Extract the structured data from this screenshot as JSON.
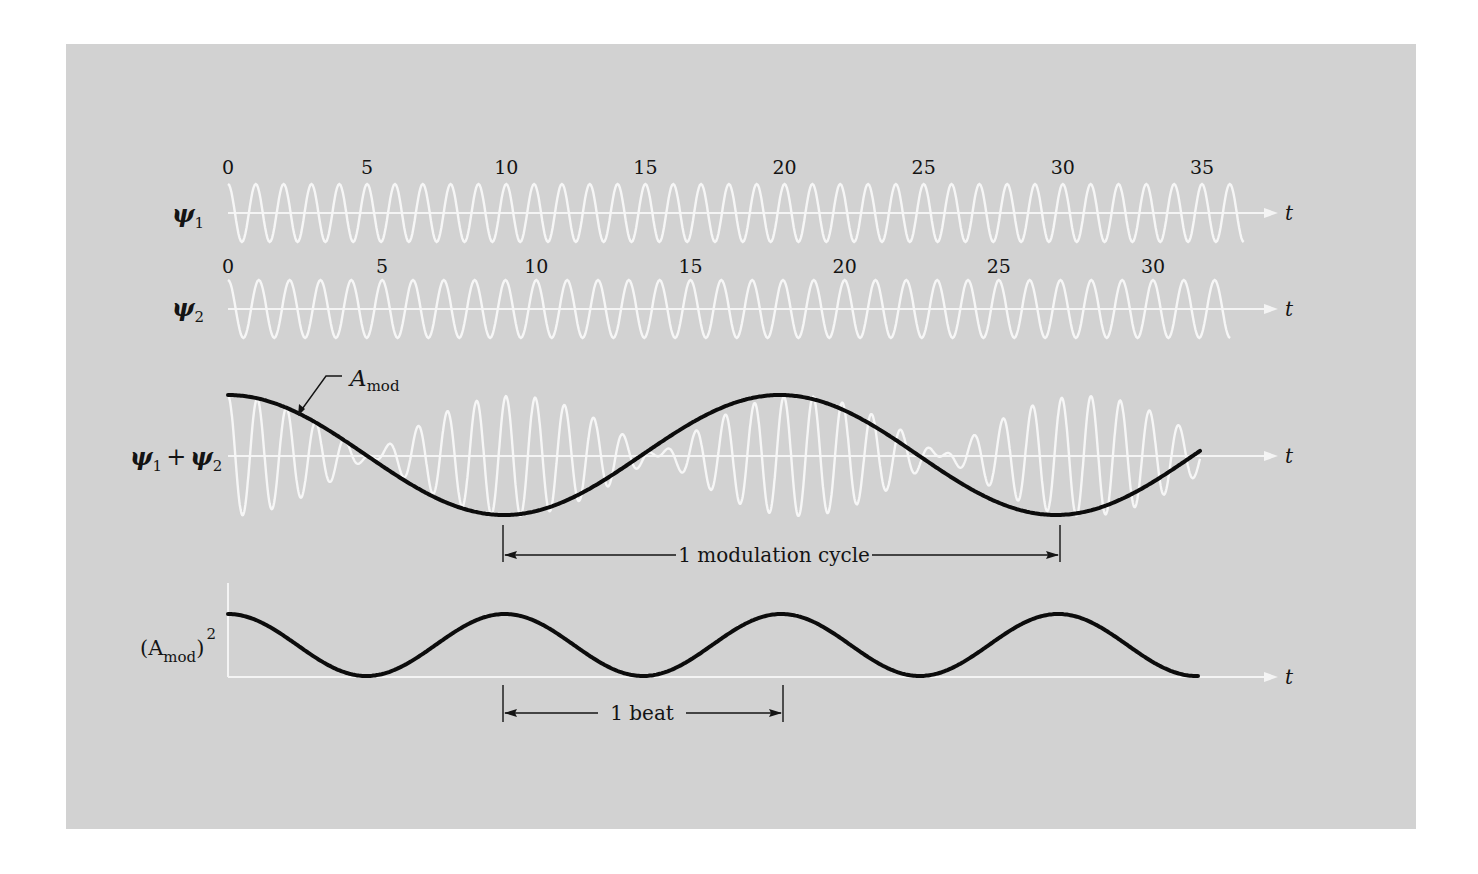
{
  "figure": {
    "background_color": "#d2d2d2",
    "wave_color": "#f6f6f6",
    "envelope_color": "#0c0c0c"
  },
  "psi1": {
    "label": "ψ",
    "subscript": "1",
    "axis_label": "t",
    "ticks": [
      "0",
      "5",
      "10",
      "15",
      "20",
      "25",
      "30",
      "35"
    ],
    "tick_values": [
      0,
      5,
      10,
      15,
      20,
      25,
      30,
      35
    ],
    "t_max": 36.5
  },
  "psi2": {
    "label": "ψ",
    "subscript": "2",
    "axis_label": "t",
    "ticks": [
      "0",
      "5",
      "10",
      "15",
      "20",
      "25",
      "30"
    ],
    "tick_values": [
      0,
      5,
      10,
      15,
      20,
      25,
      30
    ],
    "t_max": 32.5
  },
  "sum": {
    "label_a": "ψ",
    "sub_a": "1",
    "plus": "+",
    "label_b": "ψ",
    "sub_b": "2",
    "axis_label": "t",
    "envelope_label": "A",
    "envelope_sub": "mod",
    "modulation_cycle_label": "1 modulation cycle"
  },
  "power": {
    "label_open": "(A",
    "label_sub": "mod",
    "label_close": ")",
    "label_sup": "2",
    "axis_label": "t",
    "beat_label": "1 beat"
  },
  "chart_data": {
    "type": "line",
    "title": "",
    "xlabel": "t",
    "series": [
      {
        "name": "ψ1",
        "description": "cos oscillation, 1 cycle per unit t",
        "frequency_cycles_per_unit": 1.0,
        "t_range": [
          0,
          36.5
        ]
      },
      {
        "name": "ψ2",
        "description": "cos oscillation, slightly lower frequency",
        "frequency_cycles_per_unit": 1.0,
        "t_range": [
          0,
          32.5
        ]
      },
      {
        "name": "ψ1 + ψ2",
        "description": "superposition showing amplitude modulation"
      },
      {
        "name": "A_mod",
        "description": "modulation envelope, one full cycle spans ~20 units of ψ1 time"
      },
      {
        "name": "(A_mod)^2",
        "description": "beat intensity, period = half modulation cycle"
      }
    ],
    "annotations": [
      "1 modulation cycle",
      "1 beat"
    ]
  }
}
